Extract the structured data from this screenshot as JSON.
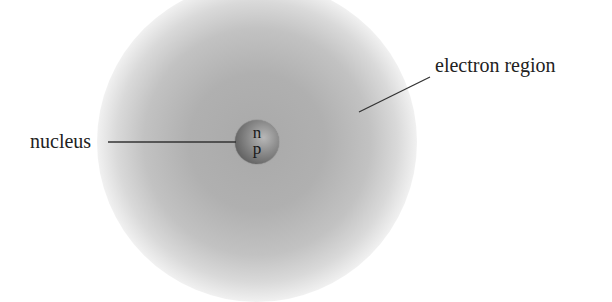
{
  "diagram": {
    "labels": {
      "nucleus": "nucleus",
      "electron_region": "electron region"
    },
    "nucleus_particles": {
      "neutron": "n",
      "proton": "p"
    },
    "colors": {
      "cloud": "#b0b0b0",
      "nucleus": "#6e6e6e",
      "text": "#222222"
    }
  }
}
